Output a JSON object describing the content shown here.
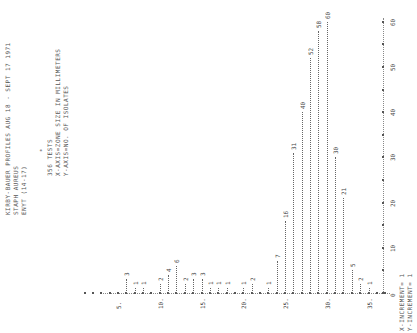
{
  "header": {
    "line1": "KIRBY-BAUER PROFILES  AUG 18 - SEPT 17 1971",
    "line2": "STAPH AUREUS",
    "line3": "ENYT (14-17)",
    "marker": "*",
    "tests": "356 TESTS",
    "xaxis_desc": "X-AXIS=ZONE SIZE IN MILLIMETERS",
    "yaxis_desc": "Y-AXIS=NO. OF ISOLATES"
  },
  "footer": {
    "x_increment": "X-INCREMENT= 1",
    "y_increment": "Y-INCREMENT= 1"
  },
  "chart_data": {
    "type": "bar",
    "orientation": "rotated 90 degrees counter-clockwise (printout)",
    "title": "KIRBY-BAUER PROFILES AUG 18 - SEPT 17 1971",
    "subtitle": "STAPH AUREUS / ENYT (14-17) / 356 TESTS",
    "xlabel": "ZONE SIZE IN MILLIMETERS",
    "ylabel": "NO. OF ISOLATES",
    "x_tick_labels": [
      "5.",
      "10.",
      "15.",
      "20.",
      "25.",
      "30.",
      "35."
    ],
    "y_tick_labels": [
      "0",
      "10",
      "20",
      "30",
      "40",
      "50",
      "60"
    ],
    "xlim": [
      5,
      37
    ],
    "ylim": [
      0,
      62
    ],
    "grid": false,
    "categories": [
      6,
      7,
      8,
      10,
      11,
      12,
      13,
      14,
      15,
      16,
      17,
      18,
      20,
      21,
      23,
      24,
      25,
      26,
      27,
      28,
      29,
      30,
      31,
      32,
      33,
      34,
      35
    ],
    "values": [
      3,
      1,
      1,
      2,
      4,
      6,
      2,
      3,
      3,
      1,
      1,
      1,
      1,
      2,
      1,
      7,
      16,
      31,
      40,
      52,
      58,
      60,
      30,
      21,
      5,
      2,
      1
    ]
  }
}
